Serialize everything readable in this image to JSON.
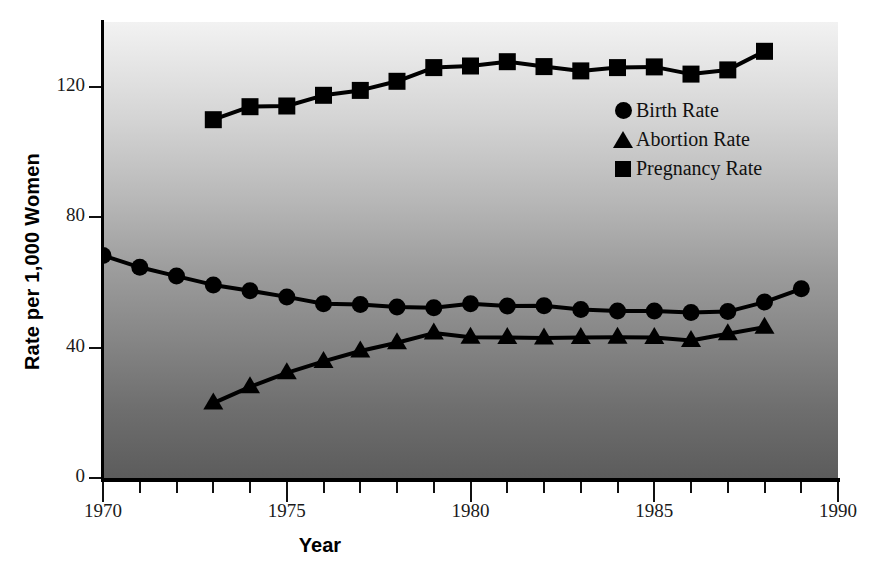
{
  "chart_data": {
    "type": "line",
    "title": "",
    "xlabel": "Year",
    "ylabel": "Rate per 1,000 Women",
    "xlim": [
      1970,
      1990
    ],
    "ylim": [
      0,
      140
    ],
    "ytick_values": [
      0,
      40,
      80,
      120
    ],
    "ytick_labels": [
      "0",
      "40",
      "80",
      "120"
    ],
    "xtick_values": [
      1970,
      1971,
      1972,
      1973,
      1974,
      1975,
      1976,
      1977,
      1978,
      1979,
      1980,
      1981,
      1982,
      1983,
      1984,
      1985,
      1986,
      1987,
      1988,
      1989,
      1990
    ],
    "xtick_labels_major": [
      "1970",
      "1975",
      "1980",
      "1985",
      "1990"
    ],
    "xtick_major_values": [
      1970,
      1975,
      1980,
      1985,
      1990
    ],
    "grid": false,
    "legend_position": "upper right",
    "series": [
      {
        "name": "Birth Rate",
        "marker": "circle",
        "color": "#000000",
        "x": [
          1970,
          1971,
          1972,
          1973,
          1974,
          1975,
          1976,
          1977,
          1978,
          1979,
          1980,
          1981,
          1982,
          1983,
          1984,
          1985,
          1986,
          1987,
          1988,
          1989
        ],
        "values": [
          68.3,
          64.7,
          62.0,
          59.3,
          57.5,
          55.6,
          53.5,
          53.3,
          52.5,
          52.3,
          53.5,
          52.8,
          52.9,
          51.7,
          51.3,
          51.3,
          50.8,
          51.1,
          54.0,
          58.1
        ]
      },
      {
        "name": "Abortion Rate",
        "marker": "triangle",
        "color": "#000000",
        "x": [
          1973,
          1974,
          1975,
          1976,
          1977,
          1978,
          1979,
          1980,
          1981,
          1982,
          1983,
          1984,
          1985,
          1986,
          1987,
          1988
        ],
        "values": [
          23.0,
          28.0,
          32.3,
          35.8,
          39.0,
          41.5,
          44.5,
          43.2,
          43.1,
          43.0,
          43.1,
          43.2,
          43.1,
          42.2,
          44.3,
          46.3
        ]
      },
      {
        "name": "Pregnancy Rate",
        "marker": "square",
        "color": "#000000",
        "x": [
          1973,
          1974,
          1975,
          1976,
          1977,
          1978,
          1979,
          1980,
          1981,
          1982,
          1983,
          1984,
          1985,
          1986,
          1987,
          1988
        ],
        "values": [
          110.0,
          114.0,
          114.2,
          117.5,
          119.0,
          121.8,
          126.0,
          126.5,
          127.8,
          126.3,
          125.0,
          126.0,
          126.2,
          124.0,
          125.3,
          131.0
        ]
      }
    ]
  },
  "axes": {
    "ylabel": "Rate per 1,000 Women",
    "xlabel": "Year"
  },
  "legend": {
    "items": [
      {
        "label": "Birth Rate",
        "marker": "circle-marker"
      },
      {
        "label": "Abortion Rate",
        "marker": "triangle-marker"
      },
      {
        "label": "Pregnancy Rate",
        "marker": "square-marker"
      }
    ]
  }
}
